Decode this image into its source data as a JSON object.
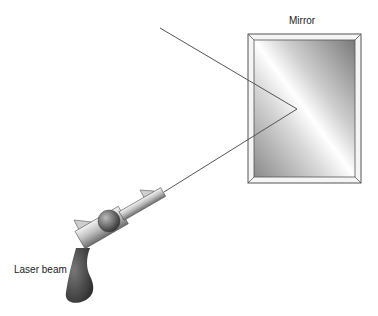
{
  "labels": {
    "mirror": "Mirror",
    "laser": "Laser beam"
  },
  "colors": {
    "beam": "#555555",
    "frame": "#f2f2f2",
    "frame_stroke": "#555555",
    "handle": "#3a3a3a"
  }
}
